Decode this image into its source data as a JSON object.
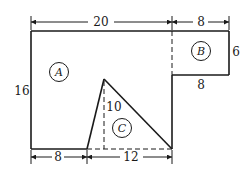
{
  "figure": {
    "regions": [
      {
        "id": "A",
        "label": "A"
      },
      {
        "id": "B",
        "label": "B"
      },
      {
        "id": "C",
        "label": "C"
      }
    ],
    "dimensions": {
      "top_main_width": "20",
      "top_b_width": "8",
      "b_height": "6",
      "b_bottom": "8",
      "left_height": "16",
      "triangle_height": "10",
      "bottom_left": "8",
      "bottom_triangle_base": "12"
    },
    "colors": {
      "line": "#1a1a1a",
      "background": "#ffffff"
    }
  }
}
